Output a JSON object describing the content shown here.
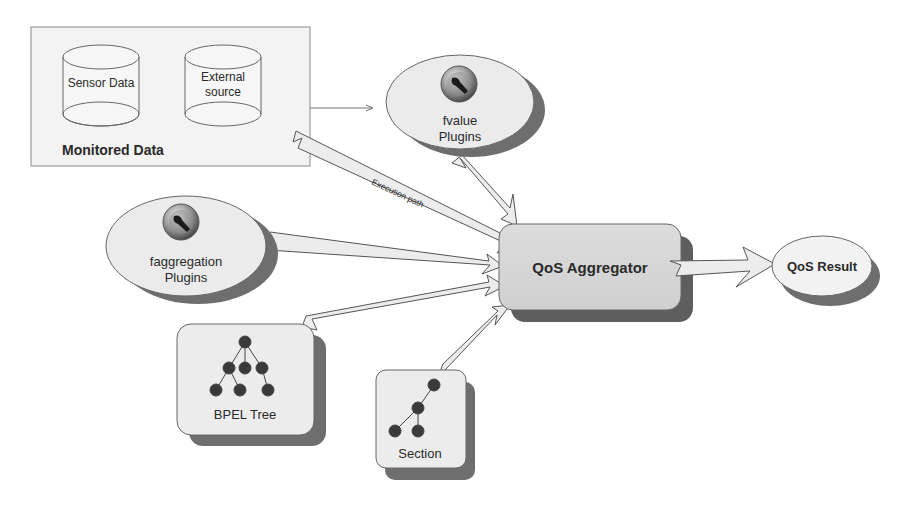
{
  "diagram": {
    "monitored_data": {
      "title": "Monitored Data",
      "stores": [
        {
          "label_lines": [
            "Sensor Data"
          ]
        },
        {
          "label_lines": [
            "External",
            "source"
          ]
        }
      ]
    },
    "fvalue_plugins": {
      "line1": "fvalue",
      "line2": "Plugins",
      "icon": "wrench-plugin-icon"
    },
    "faggregation_plugins": {
      "line1": "faggregation",
      "line2": "Plugins",
      "icon": "wrench-plugin-icon"
    },
    "bpel_tree": {
      "label": "BPEL Tree",
      "icon": "tree-icon"
    },
    "section": {
      "label": "Section",
      "icon": "subtree-icon"
    },
    "aggregator": {
      "label": "QoS Aggregator"
    },
    "result": {
      "label": "QoS Result"
    },
    "edges": [
      {
        "from": "Monitored Data",
        "to": "fvalue Plugins",
        "style": "thin-arrow"
      },
      {
        "from": "Monitored Data",
        "to": "QoS Aggregator",
        "style": "wedge",
        "label": "Execution path"
      },
      {
        "from": "fvalue Plugins",
        "to": "QoS Aggregator",
        "style": "wedge"
      },
      {
        "from": "faggregation Plugins",
        "to": "QoS Aggregator",
        "style": "wedge"
      },
      {
        "from": "BPEL Tree",
        "to": "QoS Aggregator",
        "style": "wedge"
      },
      {
        "from": "Section",
        "to": "QoS Aggregator",
        "style": "wedge"
      },
      {
        "from": "QoS Aggregator",
        "to": "QoS Result",
        "style": "wedge"
      }
    ],
    "colors": {
      "node_fill": "#d8d8d8",
      "panel_fill": "#f2f2f2",
      "shadow": "#6e6e6e",
      "wedge_fill": "#ececec",
      "stroke": "#555555"
    }
  }
}
